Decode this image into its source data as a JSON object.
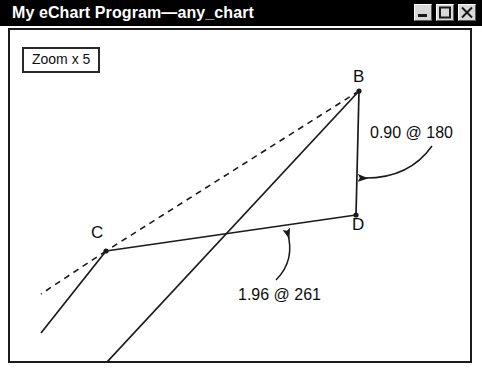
{
  "window": {
    "title": "My eChart Program—any_chart",
    "buttons": [
      {
        "name": "minimize-button",
        "icon": "minimize-icon",
        "label": "Minimize"
      },
      {
        "name": "maximize-button",
        "icon": "maximize-icon",
        "label": "Maximize"
      },
      {
        "name": "close-button",
        "icon": "close-icon",
        "label": "Close"
      }
    ]
  },
  "chart_data": {
    "type": "scatter",
    "title": "",
    "xlabel": "",
    "ylabel": "",
    "grid": false,
    "legend": null,
    "zoom_label": "Zoom x 5",
    "points": [
      {
        "id": "B",
        "label": "B",
        "x": 351,
        "y": 63,
        "label_x": 345,
        "label_y": 40
      },
      {
        "id": "C",
        "label": "C",
        "x": 98,
        "y": 223,
        "label_x": 83,
        "label_y": 196
      },
      {
        "id": "D",
        "label": "D",
        "x": 348,
        "y": 187,
        "label_x": 344,
        "label_y": 188
      }
    ],
    "segments": [
      {
        "name": "bd-segment",
        "from": "B",
        "to": "D",
        "style": "solid"
      },
      {
        "name": "cd-segment",
        "from": "C",
        "to": "D",
        "style": "solid"
      },
      {
        "name": "bc-segment",
        "from": "B",
        "to": "C",
        "style": "dashed"
      }
    ],
    "rays": [
      {
        "name": "dashed-ray-from-c",
        "style": "dashed",
        "x1": 98,
        "y1": 223,
        "x2": 33,
        "y2": 266
      },
      {
        "name": "solid-ray-from-c",
        "style": "solid",
        "x1": 98,
        "y1": 223,
        "x2": 33,
        "y2": 305
      },
      {
        "name": "solid-ray-from-b",
        "style": "solid",
        "x1": 351,
        "y1": 63,
        "x2": 86,
        "y2": 348
      }
    ],
    "annotations": [
      {
        "name": "bd-measure",
        "text": "0.90 @ 180",
        "value": 0.9,
        "angle": 180,
        "text_x": 362,
        "text_y": 97,
        "arrow": {
          "start_x": 424,
          "start_y": 118,
          "ctrl_x": 400,
          "ctrl_y": 152,
          "end_x": 352,
          "end_y": 150
        }
      },
      {
        "name": "cd-measure",
        "text": "1.96 @ 261",
        "value": 1.96,
        "angle": 261,
        "text_x": 230,
        "text_y": 259,
        "arrow": {
          "start_x": 268,
          "start_y": 252,
          "ctrl_x": 288,
          "ctrl_y": 232,
          "end_x": 279,
          "end_y": 203
        }
      }
    ],
    "colors": {
      "line": "#1a1a1a",
      "text": "#0d0d0d",
      "background": "#ffffff",
      "titlebar": "#000000",
      "titlebar_text": "#ffffff"
    }
  }
}
